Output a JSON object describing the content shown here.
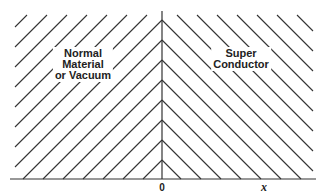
{
  "diagram": {
    "type": "interface-hatching",
    "colors": {
      "line": "#333333",
      "background": "#ffffff"
    },
    "geometry": {
      "axis_x": 162,
      "axis_top": 11,
      "baseline_y": 179,
      "baseline_left": 10,
      "baseline_right": 316,
      "hatch_left": 15,
      "hatch_right": 313,
      "hatch_top": 15,
      "hatch_spacing": 20
    },
    "regions": [
      {
        "id": "left",
        "lines": [
          "Normal",
          "Material",
          "or Vacuum"
        ],
        "center_x": 83,
        "top_y": 47
      },
      {
        "id": "right",
        "lines": [
          "Super",
          "Conductor"
        ],
        "center_x": 241,
        "top_y": 47
      }
    ],
    "axis_labels": {
      "origin": "0",
      "x": "x"
    }
  }
}
